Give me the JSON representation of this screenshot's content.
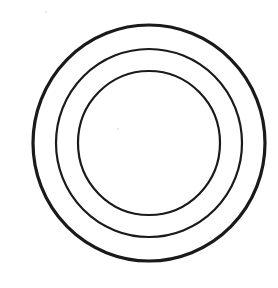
{
  "diagram": {
    "type": "concentric-circles",
    "ring_count": 3,
    "rings": [
      {
        "name": "outer-circle",
        "stroke_color": "#1a1a1a",
        "weight": "heavy"
      },
      {
        "name": "middle-circle",
        "stroke_color": "#1a1a1a",
        "weight": "regular"
      },
      {
        "name": "inner-circle",
        "stroke_color": "#1a1a1a",
        "weight": "regular"
      }
    ],
    "background_color": "#ffffff",
    "labels": []
  }
}
